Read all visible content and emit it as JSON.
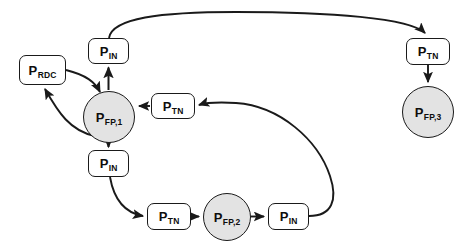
{
  "diagram": {
    "background_color": "#ffffff",
    "stroke_color": "#1a1a1a",
    "circle_fill": "#e3e3e3",
    "box_fill": "#ffffff",
    "nodes": [
      {
        "id": "p_rdc",
        "shape": "box",
        "base": "P",
        "sub": "RDC",
        "text": "P RDC",
        "x": 19,
        "y": 55,
        "w": 47,
        "h": 30
      },
      {
        "id": "p_in_top",
        "shape": "box",
        "base": "P",
        "sub": "IN",
        "text": "P IN",
        "x": 88,
        "y": 38,
        "w": 41,
        "h": 26
      },
      {
        "id": "p_fp_1",
        "shape": "circle",
        "base": "P",
        "sub": "FP,1",
        "text": "P FP,1",
        "x": 83,
        "y": 91,
        "w": 52,
        "h": 52
      },
      {
        "id": "p_tn_mid",
        "shape": "box",
        "base": "P",
        "sub": "TN",
        "text": "P TN",
        "x": 151,
        "y": 93,
        "w": 44,
        "h": 26
      },
      {
        "id": "p_in_mid",
        "shape": "box",
        "base": "P",
        "sub": "IN",
        "text": "P IN",
        "x": 88,
        "y": 150,
        "w": 41,
        "h": 27
      },
      {
        "id": "p_tn_bot",
        "shape": "box",
        "base": "P",
        "sub": "TN",
        "text": "P TN",
        "x": 147,
        "y": 203,
        "w": 44,
        "h": 27
      },
      {
        "id": "p_fp_2",
        "shape": "circle",
        "base": "P",
        "sub": "FP,2",
        "text": "P FP,2",
        "x": 203,
        "y": 193,
        "w": 48,
        "h": 48
      },
      {
        "id": "p_in_bot",
        "shape": "box",
        "base": "P",
        "sub": "IN",
        "text": "P IN",
        "x": 268,
        "y": 203,
        "w": 41,
        "h": 27
      },
      {
        "id": "p_tn_rt",
        "shape": "box",
        "base": "P",
        "sub": "TN",
        "text": "P TN",
        "x": 406,
        "y": 38,
        "w": 44,
        "h": 27
      },
      {
        "id": "p_fp_3",
        "shape": "circle",
        "base": "P",
        "sub": "FP,3",
        "text": "P FP,3",
        "x": 402,
        "y": 86,
        "w": 52,
        "h": 52
      }
    ],
    "edges": [
      {
        "id": "e1",
        "from": "p_fp_1",
        "to": "p_in_top",
        "kind": "straight-up"
      },
      {
        "id": "e2",
        "from": "p_in_top",
        "to": "p_tn_rt",
        "kind": "long-top-arc"
      },
      {
        "id": "e3",
        "from": "p_tn_rt",
        "to": "p_fp_3",
        "kind": "straight-down"
      },
      {
        "id": "e4",
        "from": "p_fp_1",
        "to": "p_rdc",
        "kind": "curve-upper"
      },
      {
        "id": "e5",
        "from": "p_rdc",
        "to": "p_fp_1",
        "kind": "curve-lower"
      },
      {
        "id": "e6",
        "from": "p_tn_mid",
        "to": "p_fp_1",
        "kind": "straight-left"
      },
      {
        "id": "e7",
        "from": "p_in_bot",
        "to": "p_tn_mid",
        "kind": "long-right-arc"
      },
      {
        "id": "e8",
        "from": "p_fp_1",
        "to": "p_in_mid",
        "kind": "straight-down"
      },
      {
        "id": "e9",
        "from": "p_in_mid",
        "to": "p_tn_bot",
        "kind": "curve-down-right"
      },
      {
        "id": "e10",
        "from": "p_tn_bot",
        "to": "p_fp_2",
        "kind": "straight-right"
      },
      {
        "id": "e11",
        "from": "p_fp_2",
        "to": "p_in_bot",
        "kind": "straight-right"
      }
    ]
  }
}
